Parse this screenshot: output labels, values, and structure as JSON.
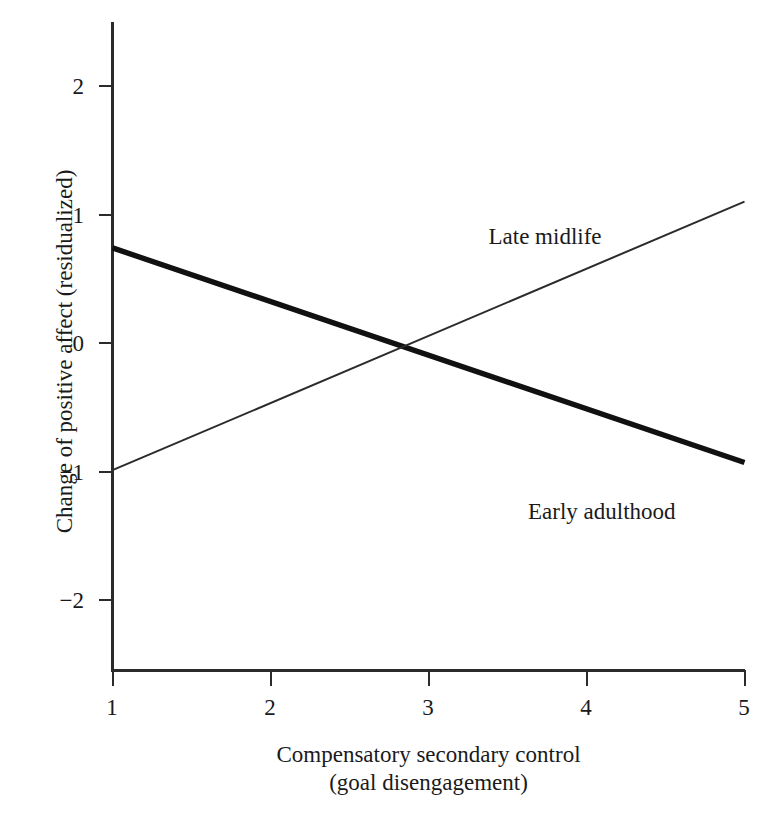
{
  "chart_data": {
    "type": "line",
    "title": "",
    "xlabel": "Compensatory secondary control\n(goal disengagement)",
    "xlabel_line1": "Compensatory secondary control",
    "xlabel_line2": "(goal disengagement)",
    "ylabel": "Change of positive affect (residualized)",
    "xlim": [
      1,
      5
    ],
    "ylim": [
      -2.45,
      2.5
    ],
    "xticks": [
      1,
      2,
      3,
      4,
      5
    ],
    "xticklabels": [
      "1",
      "2",
      "3",
      "4",
      "5"
    ],
    "yticks": [
      2,
      1,
      0,
      -1,
      -2
    ],
    "yticklabels": [
      "2",
      "1",
      "0",
      "−1",
      "−2"
    ],
    "grid": false,
    "legend": "inline annotations",
    "series": [
      {
        "name": "Early adulthood",
        "style": "thick solid black",
        "color": "#111111",
        "linewidth": 5.4,
        "x": [
          1,
          5
        ],
        "values": [
          0.74,
          -0.93
        ],
        "label_text": "Early adulthood",
        "label_x": 3.63,
        "label_y": -1.22
      },
      {
        "name": "Late midlife",
        "style": "thin solid black",
        "color": "#2b2b2b",
        "linewidth": 2.0,
        "x": [
          1,
          5
        ],
        "values": [
          -0.99,
          1.1
        ],
        "label_text": "Late midlife",
        "label_x": 3.38,
        "label_y": 0.92
      }
    ],
    "annotations": [
      {
        "text": "Late midlife",
        "x": 3.38,
        "y": 0.92
      },
      {
        "text": "Early adulthood",
        "x": 3.63,
        "y": -1.22
      }
    ],
    "axis_color": "#2b2b2b",
    "background_color": "#ffffff"
  }
}
